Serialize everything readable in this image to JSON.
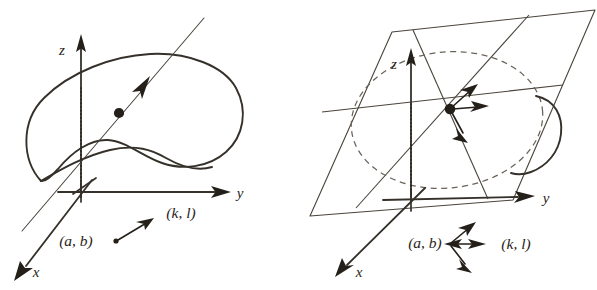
{
  "figure": {
    "background_color": "#ffffff",
    "stroke_color": "#35302a",
    "accent_color": "#241f19",
    "dashed_color": "#6a635a"
  },
  "panels": [
    {
      "id": "left",
      "name": "characteristic-direction-panel",
      "description": "Solution surface blob with a characteristic line through a point",
      "axes": [
        {
          "name": "z-axis",
          "label": "z",
          "direction": "up"
        },
        {
          "name": "y-axis",
          "label": "y",
          "direction": "right"
        },
        {
          "name": "x-axis",
          "label": "x",
          "direction": "down-left"
        }
      ],
      "annotations": [
        {
          "name": "base-point-label",
          "label": "(a, b)"
        },
        {
          "name": "direction-vector-label",
          "label": "(k, l)"
        }
      ],
      "elements": [
        {
          "name": "solution-surface",
          "kind": "blob-curve"
        },
        {
          "name": "characteristic-line",
          "kind": "thin-line-with-arrow"
        },
        {
          "name": "surface-point",
          "kind": "filled-dot"
        },
        {
          "name": "projection-dotted-line",
          "kind": "dotted-vertical"
        }
      ]
    },
    {
      "id": "right",
      "name": "tangent-plane-panel",
      "description": "Tangent plane at the point with a fan of admissible characteristic directions",
      "axes": [
        {
          "name": "z-axis",
          "label": "z",
          "direction": "up"
        },
        {
          "name": "y-axis",
          "label": "y",
          "direction": "right"
        },
        {
          "name": "x-axis",
          "label": "x",
          "direction": "down-left"
        }
      ],
      "annotations": [
        {
          "name": "base-point-label",
          "label": "(a, b)"
        },
        {
          "name": "direction-vector-label",
          "label": "(k, l)"
        }
      ],
      "elements": [
        {
          "name": "tangent-plane",
          "kind": "parallelogram"
        },
        {
          "name": "monge-cone-dashed",
          "kind": "dashed-ellipse"
        },
        {
          "name": "tangency-point",
          "kind": "filled-dot"
        },
        {
          "name": "direction-fan",
          "kind": "three-arrows"
        },
        {
          "name": "projection-dotted-line",
          "kind": "dotted-vertical"
        },
        {
          "name": "surface-fragment",
          "kind": "blob-curve"
        }
      ]
    }
  ]
}
